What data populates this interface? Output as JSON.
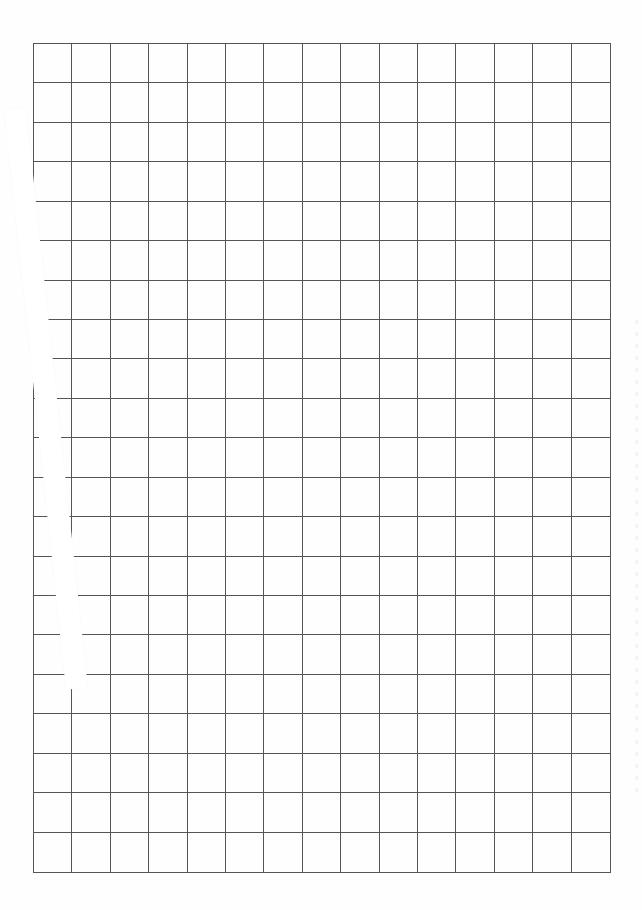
{
  "page": {
    "type": "blank grid paper",
    "background_color": "#fefefe",
    "line_color": "#555555"
  },
  "grid": {
    "columns": 15,
    "rows": 21,
    "left": 33,
    "top": 43,
    "right": 611,
    "bottom": 873,
    "cell_width": 38.5,
    "cell_height": 39.5
  },
  "overlay_strip": {
    "description": "white diagonal paper strip covering left edge",
    "color": "#ffffff",
    "start": [
      4,
      110
    ],
    "end": [
      66,
      690
    ],
    "width": 22
  }
}
